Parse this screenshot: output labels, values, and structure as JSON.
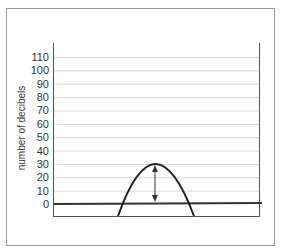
{
  "chart_data": {
    "type": "line",
    "title": "",
    "xlabel": "",
    "ylabel": "number of decibels",
    "ylim": [
      0,
      110
    ],
    "yticks": [
      0,
      10,
      20,
      30,
      40,
      50,
      60,
      70,
      80,
      90,
      100,
      110
    ],
    "grid": true,
    "legend": null,
    "series": [
      {
        "name": "sound wave (parabolic peak)",
        "shape": "inverted parabola",
        "peak": 30,
        "x_relative": [
          0.31,
          0.34,
          0.4,
          0.49,
          0.58,
          0.64,
          0.68
        ],
        "values": [
          -5,
          0,
          20,
          30,
          20,
          0,
          -5
        ]
      }
    ],
    "baseline": {
      "value": 0,
      "style": "thick line"
    },
    "annotations": [
      {
        "type": "double-arrow",
        "from": 30,
        "to": 0,
        "description": "amplitude arrow from baseline to peak"
      }
    ]
  },
  "axis": {
    "ylabel": "number of decibels",
    "ticks": [
      "110",
      "100",
      "90",
      "80",
      "70",
      "60",
      "50",
      "40",
      "30",
      "20",
      "10",
      "0"
    ]
  },
  "colors": {
    "frame": "#9a9a9a",
    "grid": "#d8d8d8",
    "axis": "#555555",
    "curve": "#222222",
    "baseline": "#333333"
  }
}
